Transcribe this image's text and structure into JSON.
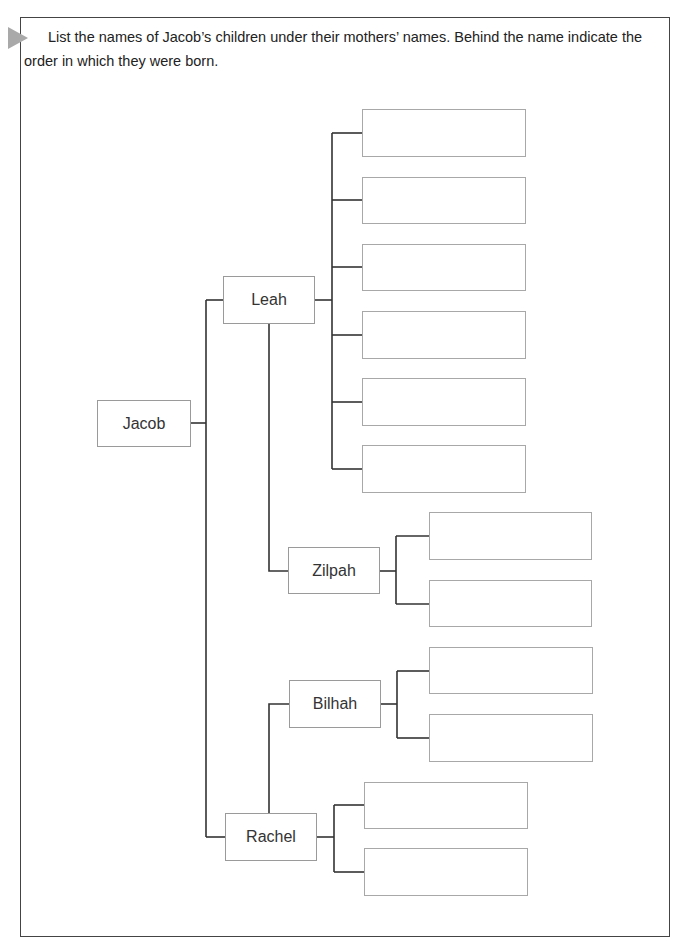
{
  "instructions": "List the names of Jacob’s children under their mothers’ names. Behind the name indicate the order in which they were born.",
  "marker_icon": "play-triangle-icon",
  "tree": {
    "root": {
      "label": "Jacob"
    },
    "mothers": [
      {
        "label": "Leah",
        "answer_slots": 6
      },
      {
        "label": "Zilpah",
        "answer_slots": 2
      },
      {
        "label": "Bilhah",
        "answer_slots": 2
      },
      {
        "label": "Rachel",
        "answer_slots": 2
      }
    ],
    "answers": {
      "leah": [
        "",
        "",
        "",
        "",
        "",
        ""
      ],
      "zilpah": [
        "",
        ""
      ],
      "bilhah": [
        "",
        ""
      ],
      "rachel": [
        "",
        ""
      ]
    }
  },
  "colors": {
    "frame_border": "#444444",
    "marker": "#a9a9a9",
    "connector": "#333333",
    "box_border": "#9a9a9a"
  }
}
